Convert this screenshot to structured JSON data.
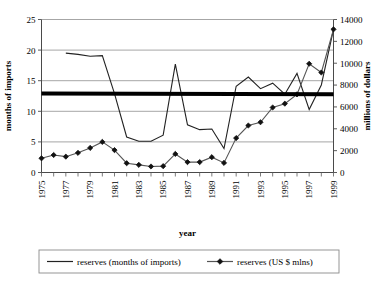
{
  "chart_data": {
    "type": "line",
    "title": "",
    "xlabel": "year",
    "ylabel": "months of imports",
    "y2label": "millions of dollars",
    "grid": true,
    "legend_position": "bottom",
    "x": [
      1975,
      1976,
      1977,
      1978,
      1979,
      1980,
      1981,
      1982,
      1983,
      1984,
      1985,
      1986,
      1987,
      1988,
      1989,
      1990,
      1991,
      1992,
      1993,
      1994,
      1995,
      1996,
      1997,
      1998,
      1999
    ],
    "xlim": [
      1975,
      1999
    ],
    "xtick_labels": [
      "1975",
      "1977",
      "1979",
      "1981",
      "1983",
      "1985",
      "1987",
      "1989",
      "1991",
      "1993",
      "1995",
      "1997",
      "1999"
    ],
    "ylim": [
      0,
      25
    ],
    "ytick_labels": [
      "0",
      "5",
      "10",
      "15",
      "20",
      "25"
    ],
    "y2lim": [
      0,
      14000
    ],
    "y2tick_labels": [
      "0",
      "2000",
      "4000",
      "6000",
      "8000",
      "10000",
      "12000",
      "14000"
    ],
    "series": [
      {
        "name": "reserves (months of imports)",
        "axis": "left",
        "marker": "none",
        "color": "#222222",
        "x": [
          1977,
          1978,
          1979,
          1980,
          1981,
          1982,
          1983,
          1984,
          1985,
          1986,
          1987,
          1988,
          1989,
          1990,
          1991,
          1992,
          1993,
          1994,
          1995,
          1996,
          1997,
          1998,
          1999
        ],
        "values": [
          19.5,
          19.3,
          19.0,
          19.1,
          12.9,
          5.8,
          5.1,
          5.1,
          6.1,
          17.7,
          7.8,
          7.0,
          7.1,
          3.9,
          14.1,
          15.6,
          13.7,
          14.6,
          12.8,
          16.2,
          10.3,
          14.3,
          23.4
        ]
      },
      {
        "name": "reserves (US $ mlns)",
        "axis": "right",
        "marker": "diamond",
        "color": "#555555",
        "x": [
          1975,
          1976,
          1977,
          1978,
          1979,
          1980,
          1981,
          1982,
          1983,
          1984,
          1985,
          1986,
          1987,
          1988,
          1989,
          1990,
          1991,
          1992,
          1993,
          1994,
          1995,
          1996,
          1997,
          1998,
          1999
        ],
        "values": [
          1300,
          1600,
          1450,
          1800,
          2250,
          2800,
          2050,
          850,
          700,
          550,
          580,
          1700,
          950,
          950,
          1400,
          880,
          3150,
          4300,
          4600,
          5950,
          6300,
          7150,
          9950,
          9150,
          13100
        ]
      },
      {
        "name": "threshold",
        "axis": "left",
        "marker": "none",
        "color": "#000000",
        "width": 4,
        "x": [
          1975,
          1999
        ],
        "values": [
          12.9,
          12.8
        ]
      }
    ],
    "legend": [
      {
        "label": "reserves (months of imports)",
        "marker": "line"
      },
      {
        "label": "reserves (US $ mlns)",
        "marker": "line-diamond"
      }
    ]
  }
}
